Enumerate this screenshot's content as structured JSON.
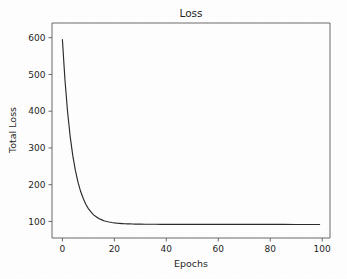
{
  "chart_data": {
    "type": "line",
    "title": "Loss",
    "xlabel": "Epochs",
    "ylabel": "Total Loss",
    "xlim": [
      -4,
      103
    ],
    "ylim": [
      55,
      640
    ],
    "grid": false,
    "legend": null,
    "line_color": "#2b2b2b",
    "background_color": "#ffffff",
    "axis_color": "#4d4d4d",
    "xticks": [
      0,
      20,
      40,
      60,
      80,
      100
    ],
    "xtick_labels": [
      "0",
      "20",
      "40",
      "60",
      "80",
      "100"
    ],
    "yticks": [
      100,
      200,
      300,
      400,
      500,
      600
    ],
    "ytick_labels": [
      "100",
      "200",
      "300",
      "400",
      "500",
      "600"
    ],
    "series": [
      {
        "name": "Total Loss",
        "x": [
          0,
          1,
          2,
          3,
          4,
          5,
          6,
          7,
          8,
          9,
          10,
          11,
          12,
          13,
          14,
          15,
          16,
          17,
          18,
          19,
          20,
          21,
          22,
          23,
          24,
          25,
          26,
          27,
          28,
          29,
          30,
          32,
          34,
          36,
          38,
          40,
          45,
          50,
          55,
          60,
          65,
          70,
          75,
          80,
          85,
          90,
          95,
          99
        ],
        "values": [
          595,
          484,
          398,
          331,
          279,
          239,
          207,
          182,
          163,
          147,
          135,
          126,
          118,
          113,
          108,
          105,
          102,
          100,
          98.5,
          97.2,
          96.2,
          95.4,
          94.8,
          94.3,
          93.9,
          93.6,
          93.3,
          93.1,
          92.9,
          92.8,
          92.7,
          92.5,
          92.4,
          92.3,
          92.2,
          92.2,
          92.1,
          92.0,
          92.0,
          92.0,
          91.9,
          91.9,
          91.9,
          91.9,
          91.9,
          91.8,
          91.8,
          91.8
        ]
      }
    ]
  }
}
